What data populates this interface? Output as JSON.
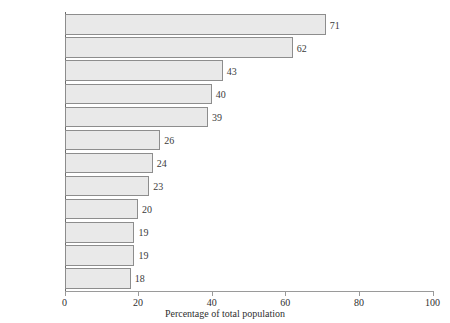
{
  "chart_data": {
    "type": "bar",
    "orientation": "horizontal",
    "title": "",
    "xlabel": "Percentage of total population",
    "ylabel": "",
    "xlim": [
      0,
      100
    ],
    "xticks": [
      0,
      20,
      40,
      60,
      80,
      100
    ],
    "grid": false,
    "legend": null,
    "categories": [
      "United Arab Emirates",
      "Kuwait",
      "Singapore",
      "Israel",
      "Jordan",
      "Saudi Arabia",
      "Oman",
      "Switzerland",
      "Australia",
      "Latvia",
      "Canada",
      "Lebanon"
    ],
    "values": [
      71,
      62,
      43,
      40,
      39,
      26,
      24,
      23,
      20,
      19,
      19,
      18
    ],
    "bar_labels": [
      "71",
      "62",
      "43",
      "40",
      "39",
      "26",
      "24",
      "23",
      "20",
      "19",
      "19",
      "18"
    ],
    "colors": {
      "bar_fill": "#e9e9e9",
      "bar_border": "#8d8d8d",
      "axis": "#9a9a9a",
      "text": "#2f2f2f"
    }
  },
  "axis": {
    "tick_labels": [
      "0",
      "20",
      "40",
      "60",
      "80",
      "100"
    ],
    "x_title": "Percentage of total population"
  }
}
